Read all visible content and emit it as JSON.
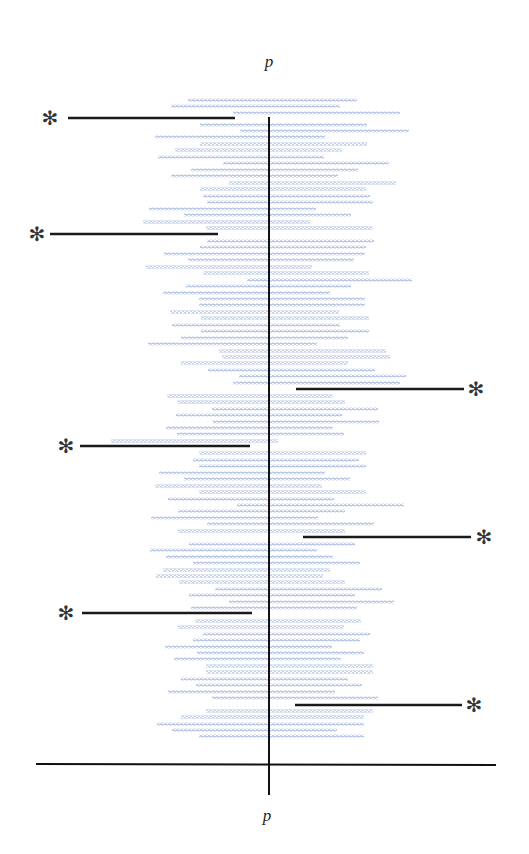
{
  "diagram": {
    "top_label": "p",
    "bottom_label": "p",
    "marker_symbol": "✻",
    "colors": {
      "row": "#8fa6d8",
      "axis": "#111111",
      "marker": "#1a1a1a",
      "background": "#ffffff"
    },
    "axes": {
      "vertical": {
        "x": 269,
        "y1": 117,
        "y2": 795
      },
      "horizontal": {
        "y": 764,
        "x1": 36,
        "x2": 496
      }
    },
    "rows": [
      {
        "y": 100,
        "x1": 188,
        "x2": 357
      },
      {
        "y": 106,
        "x1": 171,
        "x2": 340
      },
      {
        "y": 113,
        "x1": 233,
        "x2": 400
      },
      {
        "y": 125,
        "x1": 200,
        "x2": 367
      },
      {
        "y": 131,
        "x1": 240,
        "x2": 409
      },
      {
        "y": 137,
        "x1": 155,
        "x2": 325
      },
      {
        "y": 144,
        "x1": 200,
        "x2": 367
      },
      {
        "y": 150,
        "x1": 175,
        "x2": 342
      },
      {
        "y": 157,
        "x1": 158,
        "x2": 324
      },
      {
        "y": 163,
        "x1": 223,
        "x2": 389
      },
      {
        "y": 170,
        "x1": 191,
        "x2": 358
      },
      {
        "y": 176,
        "x1": 171,
        "x2": 338
      },
      {
        "y": 183,
        "x1": 229,
        "x2": 396
      },
      {
        "y": 189,
        "x1": 200,
        "x2": 366
      },
      {
        "y": 196,
        "x1": 203,
        "x2": 370
      },
      {
        "y": 202,
        "x1": 207,
        "x2": 373
      },
      {
        "y": 209,
        "x1": 149,
        "x2": 316
      },
      {
        "y": 215,
        "x1": 184,
        "x2": 351
      },
      {
        "y": 222,
        "x1": 143,
        "x2": 310
      },
      {
        "y": 228,
        "x1": 206,
        "x2": 373
      },
      {
        "y": 241,
        "x1": 207,
        "x2": 374
      },
      {
        "y": 247,
        "x1": 200,
        "x2": 366
      },
      {
        "y": 254,
        "x1": 164,
        "x2": 365
      },
      {
        "y": 260,
        "x1": 188,
        "x2": 354
      },
      {
        "y": 267,
        "x1": 146,
        "x2": 312
      },
      {
        "y": 273,
        "x1": 203,
        "x2": 369
      },
      {
        "y": 280,
        "x1": 247,
        "x2": 412
      },
      {
        "y": 286,
        "x1": 186,
        "x2": 351
      },
      {
        "y": 293,
        "x1": 163,
        "x2": 330
      },
      {
        "y": 299,
        "x1": 199,
        "x2": 365
      },
      {
        "y": 305,
        "x1": 199,
        "x2": 365
      },
      {
        "y": 312,
        "x1": 170,
        "x2": 339
      },
      {
        "y": 318,
        "x1": 201,
        "x2": 369
      },
      {
        "y": 325,
        "x1": 172,
        "x2": 340
      },
      {
        "y": 331,
        "x1": 201,
        "x2": 369
      },
      {
        "y": 338,
        "x1": 181,
        "x2": 348
      },
      {
        "y": 344,
        "x1": 148,
        "x2": 317
      },
      {
        "y": 351,
        "x1": 219,
        "x2": 386
      },
      {
        "y": 357,
        "x1": 222,
        "x2": 390
      },
      {
        "y": 363,
        "x1": 181,
        "x2": 348
      },
      {
        "y": 370,
        "x1": 208,
        "x2": 375
      },
      {
        "y": 376,
        "x1": 239,
        "x2": 406
      },
      {
        "y": 383,
        "x1": 233,
        "x2": 400
      },
      {
        "y": 396,
        "x1": 167,
        "x2": 333
      },
      {
        "y": 402,
        "x1": 178,
        "x2": 345
      },
      {
        "y": 409,
        "x1": 212,
        "x2": 378
      },
      {
        "y": 415,
        "x1": 176,
        "x2": 342
      },
      {
        "y": 422,
        "x1": 213,
        "x2": 379
      },
      {
        "y": 428,
        "x1": 166,
        "x2": 333
      },
      {
        "y": 434,
        "x1": 177,
        "x2": 344
      },
      {
        "y": 441,
        "x1": 111,
        "x2": 278
      },
      {
        "y": 453,
        "x1": 199,
        "x2": 366
      },
      {
        "y": 460,
        "x1": 193,
        "x2": 359
      },
      {
        "y": 466,
        "x1": 199,
        "x2": 366
      },
      {
        "y": 473,
        "x1": 159,
        "x2": 325
      },
      {
        "y": 479,
        "x1": 184,
        "x2": 350
      },
      {
        "y": 486,
        "x1": 155,
        "x2": 322
      },
      {
        "y": 492,
        "x1": 199,
        "x2": 366
      },
      {
        "y": 499,
        "x1": 168,
        "x2": 334
      },
      {
        "y": 505,
        "x1": 237,
        "x2": 404
      },
      {
        "y": 511,
        "x1": 178,
        "x2": 345
      },
      {
        "y": 518,
        "x1": 151,
        "x2": 318
      },
      {
        "y": 524,
        "x1": 207,
        "x2": 374
      },
      {
        "y": 531,
        "x1": 178,
        "x2": 345
      },
      {
        "y": 544,
        "x1": 189,
        "x2": 355
      },
      {
        "y": 550,
        "x1": 150,
        "x2": 317
      },
      {
        "y": 557,
        "x1": 166,
        "x2": 333
      },
      {
        "y": 563,
        "x1": 193,
        "x2": 360
      },
      {
        "y": 570,
        "x1": 163,
        "x2": 330
      },
      {
        "y": 576,
        "x1": 156,
        "x2": 323
      },
      {
        "y": 582,
        "x1": 179,
        "x2": 345
      },
      {
        "y": 589,
        "x1": 215,
        "x2": 382
      },
      {
        "y": 595,
        "x1": 189,
        "x2": 355
      },
      {
        "y": 602,
        "x1": 229,
        "x2": 394
      },
      {
        "y": 608,
        "x1": 191,
        "x2": 357
      },
      {
        "y": 621,
        "x1": 195,
        "x2": 361
      },
      {
        "y": 627,
        "x1": 178,
        "x2": 344
      },
      {
        "y": 634,
        "x1": 203,
        "x2": 370
      },
      {
        "y": 640,
        "x1": 193,
        "x2": 360
      },
      {
        "y": 647,
        "x1": 165,
        "x2": 332
      },
      {
        "y": 653,
        "x1": 197,
        "x2": 364
      },
      {
        "y": 659,
        "x1": 174,
        "x2": 341
      },
      {
        "y": 666,
        "x1": 206,
        "x2": 373
      },
      {
        "y": 672,
        "x1": 206,
        "x2": 373
      },
      {
        "y": 679,
        "x1": 181,
        "x2": 348
      },
      {
        "y": 685,
        "x1": 196,
        "x2": 362
      },
      {
        "y": 692,
        "x1": 168,
        "x2": 335
      },
      {
        "y": 698,
        "x1": 212,
        "x2": 378
      },
      {
        "y": 711,
        "x1": 206,
        "x2": 373
      },
      {
        "y": 717,
        "x1": 181,
        "x2": 364
      },
      {
        "y": 724,
        "x1": 157,
        "x2": 364
      },
      {
        "y": 730,
        "x1": 172,
        "x2": 337
      },
      {
        "y": 736,
        "x1": 199,
        "x2": 364
      }
    ],
    "markers": [
      {
        "side": "left",
        "y": 118,
        "x1": 68,
        "x2": 235,
        "star_x": 50
      },
      {
        "side": "left",
        "y": 234,
        "x1": 50,
        "x2": 218,
        "star_x": 37
      },
      {
        "side": "right",
        "y": 389,
        "x1": 296,
        "x2": 464,
        "star_x": 476
      },
      {
        "side": "left",
        "y": 446,
        "x1": 80,
        "x2": 250,
        "star_x": 66
      },
      {
        "side": "right",
        "y": 537,
        "x1": 303,
        "x2": 471,
        "star_x": 484
      },
      {
        "side": "left",
        "y": 613,
        "x1": 82,
        "x2": 252,
        "star_x": 66
      },
      {
        "side": "right",
        "y": 705,
        "x1": 295,
        "x2": 462,
        "star_x": 474
      }
    ],
    "label_positions": {
      "top": {
        "x": 269,
        "y": 52
      },
      "bottom": {
        "x": 267,
        "y": 806
      }
    }
  }
}
